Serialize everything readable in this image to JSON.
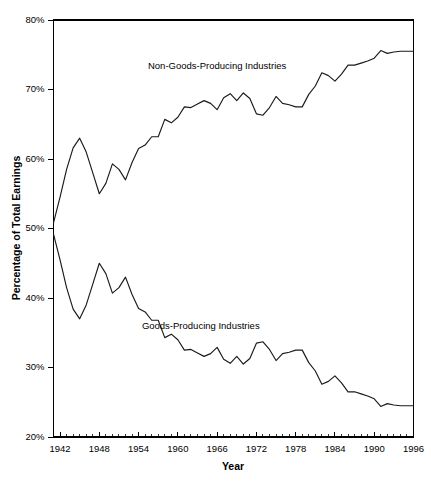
{
  "chart_data": {
    "type": "line",
    "title": "",
    "xlabel": "Year",
    "ylabel": "Percentage of Total Earnings",
    "xlim": [
      1941,
      1996
    ],
    "ylim": [
      20,
      80
    ],
    "grid": false,
    "legend_position": "inline-annotation",
    "x_tick_labels": [
      "1942",
      "1948",
      "1954",
      "1960",
      "1966",
      "1972",
      "1978",
      "1984",
      "1990",
      "1996"
    ],
    "x_tick_values": [
      1942,
      1948,
      1954,
      1960,
      1966,
      1972,
      1978,
      1984,
      1990,
      1996
    ],
    "x_minor_tick_step": 1,
    "y_tick_labels": [
      "20%",
      "30%",
      "40%",
      "50%",
      "60%",
      "70%",
      "80%"
    ],
    "y_tick_values": [
      20,
      30,
      40,
      50,
      60,
      70,
      80
    ],
    "x": [
      1941,
      1942,
      1943,
      1944,
      1945,
      1946,
      1947,
      1948,
      1949,
      1950,
      1951,
      1952,
      1953,
      1954,
      1955,
      1956,
      1957,
      1958,
      1959,
      1960,
      1961,
      1962,
      1963,
      1964,
      1965,
      1966,
      1967,
      1968,
      1969,
      1970,
      1971,
      1972,
      1973,
      1974,
      1975,
      1976,
      1977,
      1978,
      1979,
      1980,
      1981,
      1982,
      1983,
      1984,
      1985,
      1986,
      1987,
      1988,
      1989,
      1990,
      1991,
      1992,
      1993,
      1994,
      1995,
      1996
    ],
    "series": [
      {
        "name": "Non-Goods-Producing Industries",
        "annotation": "Non-Goods-Producing Industries",
        "annotation_x": 1966.0,
        "annotation_y": 73.0,
        "values": [
          50.8,
          54.5,
          58.5,
          61.6,
          63.0,
          61.0,
          58.0,
          55.0,
          56.5,
          59.3,
          58.5,
          57.0,
          59.5,
          61.5,
          62.0,
          63.2,
          63.2,
          65.7,
          65.2,
          66.0,
          67.5,
          67.4,
          67.9,
          68.4,
          68.0,
          67.1,
          68.8,
          69.4,
          68.4,
          69.5,
          68.7,
          66.5,
          66.3,
          67.4,
          69.0,
          68.0,
          67.8,
          67.5,
          67.5,
          69.3,
          70.5,
          72.4,
          72.0,
          71.2,
          72.2,
          73.5,
          73.5,
          73.8,
          74.1,
          74.5,
          75.6,
          75.2,
          75.4,
          75.5,
          75.5,
          75.5
        ]
      },
      {
        "name": "Goods-Producing Industries",
        "annotation": "Goods-Producing Industries",
        "annotation_x": 1963.5,
        "annotation_y": 35.6,
        "values": [
          49.2,
          45.5,
          41.5,
          38.4,
          37.0,
          39.0,
          42.0,
          45.0,
          43.5,
          40.7,
          41.5,
          43.0,
          40.5,
          38.5,
          38.0,
          36.8,
          36.8,
          34.3,
          34.8,
          34.0,
          32.5,
          32.6,
          32.1,
          31.6,
          32.0,
          32.9,
          31.2,
          30.6,
          31.6,
          30.5,
          31.3,
          33.5,
          33.7,
          32.6,
          31.0,
          32.0,
          32.2,
          32.5,
          32.5,
          30.7,
          29.5,
          27.6,
          28.0,
          28.8,
          27.8,
          26.5,
          26.5,
          26.2,
          25.9,
          25.5,
          24.4,
          24.8,
          24.6,
          24.5,
          24.5,
          24.5
        ]
      }
    ]
  },
  "axes": {
    "x_title": "Year",
    "y_title": "Percentage of Total Earnings"
  },
  "colors": {
    "line": "#1a1a1a",
    "axis": "#000000",
    "background": "#ffffff"
  }
}
